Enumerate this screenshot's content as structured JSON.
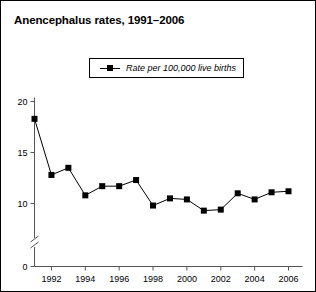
{
  "chart_data": {
    "type": "line",
    "title": "Anencephalus rates, 1991–2006",
    "xlabel": "",
    "ylabel": "",
    "legend": [
      "Rate per 100,000 live births"
    ],
    "legend_position": "top-center",
    "grid": false,
    "axis_break": true,
    "xlim": [
      1991,
      2006
    ],
    "ylim": [
      0,
      20
    ],
    "ytick_labels": [
      "0",
      "10",
      "15",
      "20"
    ],
    "ytick_values": [
      0,
      10,
      15,
      20
    ],
    "xtick_labels": [
      "1992",
      "1994",
      "1996",
      "1998",
      "2000",
      "2002",
      "2004",
      "2006"
    ],
    "xtick_values": [
      1992,
      1994,
      1996,
      1998,
      2000,
      2002,
      2004,
      2006
    ],
    "x": [
      1991,
      1992,
      1993,
      1994,
      1995,
      1996,
      1997,
      1998,
      1999,
      2000,
      2001,
      2002,
      2003,
      2004,
      2005,
      2006
    ],
    "series": [
      {
        "name": "Rate per 100,000 live births",
        "color": "#000000",
        "marker": "square",
        "values": [
          18.3,
          12.8,
          13.5,
          10.8,
          11.7,
          11.7,
          12.3,
          9.8,
          10.5,
          10.4,
          9.3,
          9.4,
          11.0,
          10.4,
          11.1,
          11.2
        ]
      }
    ]
  },
  "figure": {
    "title": "Anencephalus rates, 1991–2006",
    "legend_label": "Rate per 100,000 live births",
    "border_color": "#000000",
    "background_color": "#ffffff",
    "line_color": "#000000"
  }
}
